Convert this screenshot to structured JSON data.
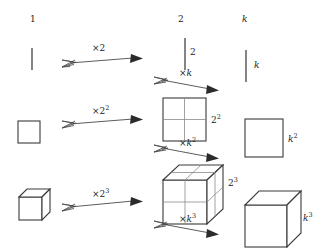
{
  "diagram": {
    "columns": [
      {
        "id": "col-unit",
        "header": "1"
      },
      {
        "id": "col-two",
        "header": "2"
      },
      {
        "id": "col-k",
        "header": "k"
      }
    ],
    "rows": [
      {
        "id": "row-1d",
        "shape": "line-segment",
        "source_label": "1",
        "middle_label": "2",
        "right_label": "k"
      },
      {
        "id": "row-2d",
        "shape": "square",
        "middle_label": "2",
        "middle_label_sup": "2",
        "right_label": "k",
        "right_label_sup": "2"
      },
      {
        "id": "row-3d",
        "shape": "cube",
        "middle_label": "2",
        "middle_label_sup": "3",
        "right_label": "k",
        "right_label_sup": "3"
      }
    ],
    "arrows": [
      {
        "id": "arrow-x2",
        "label": "×2",
        "base": "×2",
        "exponent": "",
        "from": "unit-line",
        "to": "doubled-line"
      },
      {
        "id": "arrow-xk",
        "label": "×k",
        "base": "×k",
        "exponent": "",
        "from": "doubled-line",
        "to": "k-line"
      },
      {
        "id": "arrow-x2sq",
        "label": "×2²",
        "base": "×2",
        "exponent": "2",
        "from": "unit-square",
        "to": "doubled-square"
      },
      {
        "id": "arrow-xksq",
        "label": "×k²",
        "base": "×k",
        "exponent": "2",
        "from": "doubled-square",
        "to": "k-square"
      },
      {
        "id": "arrow-x2cu",
        "label": "×2³",
        "base": "×2",
        "exponent": "3",
        "from": "unit-cube",
        "to": "doubled-cube"
      },
      {
        "id": "arrow-xkcu",
        "label": "×k³",
        "base": "×k",
        "exponent": "3",
        "from": "doubled-cube",
        "to": "k-cube"
      }
    ],
    "colors": {
      "stroke": "#3a3a3a",
      "grid": "#8a8a8a",
      "text": "#1a1a1a",
      "background": "#ffffff"
    }
  }
}
